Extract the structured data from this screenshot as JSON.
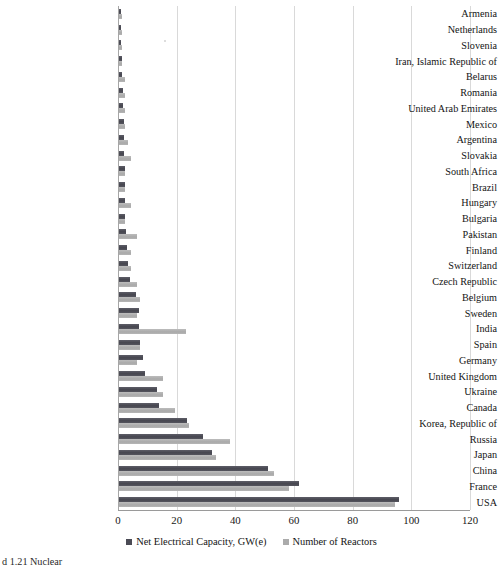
{
  "figure": {
    "caption_remnant": "d 1.21  Nuclear"
  },
  "axis": {
    "xticks": [
      "0",
      "20",
      "40",
      "60",
      "80",
      "100",
      "120"
    ],
    "xtick_values": [
      0,
      20,
      40,
      60,
      80,
      100,
      120
    ]
  },
  "legend": {
    "items": [
      {
        "label": "Net Electrical Capacity, GW(e)",
        "color": "#4b4b55",
        "key": "capacity"
      },
      {
        "label": "Number of Reactors",
        "color": "#ababab",
        "key": "reactors"
      }
    ]
  },
  "chart_data": {
    "type": "bar",
    "orientation": "horizontal",
    "title": "",
    "xlabel": "",
    "ylabel": "",
    "xlim": [
      0,
      120
    ],
    "grid": true,
    "legend_position": "bottom",
    "categories": [
      "Armenia",
      "Netherlands",
      "Slovenia",
      "Iran, Islamic Republic of",
      "Belarus",
      "Romania",
      "United Arab Emirates",
      "Mexico",
      "Argentina",
      "Slovakia",
      "South Africa",
      "Brazil",
      "Hungary",
      "Bulgaria",
      "Pakistan",
      "Finland",
      "Switzerland",
      "Czech Republic",
      "Belgium",
      "Sweden",
      "India",
      "Spain",
      "Germany",
      "United Kingdom",
      "Ukraine",
      "Canada",
      "Korea, Republic of",
      "Russia",
      "Japan",
      "China",
      "France",
      "USA"
    ],
    "series": [
      {
        "name": "Net Electrical Capacity, GW(e)",
        "color": "#4b4b55",
        "values": [
          0.4,
          0.5,
          0.7,
          0.9,
          1.1,
          1.3,
          1.4,
          1.6,
          1.6,
          1.8,
          1.9,
          2.0,
          2.0,
          2.0,
          2.3,
          2.8,
          3.0,
          3.9,
          5.9,
          6.9,
          6.9,
          7.1,
          8.1,
          8.9,
          13.1,
          13.6,
          23.2,
          28.6,
          31.7,
          50.8,
          61.4,
          95.5
        ]
      },
      {
        "name": "Number of Reactors",
        "color": "#ababab",
        "values": [
          1,
          1,
          1,
          1,
          2,
          2,
          2,
          2,
          3,
          4,
          2,
          2,
          4,
          2,
          6,
          4,
          4,
          6,
          7,
          6,
          23,
          7,
          6,
          15,
          15,
          19,
          24,
          38,
          33,
          53,
          58,
          94
        ]
      }
    ]
  }
}
